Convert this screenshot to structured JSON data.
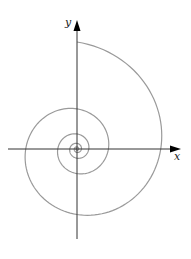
{
  "diagram": {
    "title": "",
    "type": "logarithmic-spiral",
    "axes": {
      "x_label": "x",
      "y_label": "y",
      "axis_color": "#333333",
      "origin_px": [
        77,
        149
      ],
      "x_axis_px": [
        8,
        181
      ],
      "y_axis_px": [
        239,
        20
      ]
    },
    "spiral": {
      "color": "#9a9a9a",
      "stroke_width": 1.2,
      "outer_radius_px": 107,
      "outer_angle_deg": 90,
      "radius_ratio_per_turn": 0.375,
      "turns": 5
    }
  }
}
